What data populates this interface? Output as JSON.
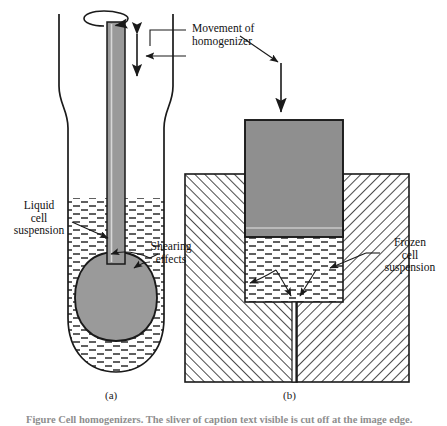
{
  "figure": {
    "type": "scientific-diagram",
    "caption_clipped": "Figure  Cell homogenizers. The sliver of caption text visible is cut off at the image edge.",
    "panels": [
      {
        "id": "a",
        "label": "(a)",
        "description": "Potter-Elvehjem style rotating pestle homogenizer in a glass tube containing liquid cell suspension"
      },
      {
        "id": "b",
        "label": "(b)",
        "description": "Frozen cell suspension forced through a narrow orifice by a descending plunger"
      }
    ]
  },
  "labels": {
    "movement": {
      "lines": [
        "Movement of",
        "homogenizer"
      ]
    },
    "liquid": {
      "lines": [
        "Liquid",
        "cell",
        "suspension"
      ]
    },
    "shearing": {
      "lines": [
        "Shearing",
        "effects"
      ]
    },
    "frozen": {
      "lines": [
        "Frozen",
        "cell",
        "suspension"
      ]
    }
  },
  "colors": {
    "outline": "#1a1a1a",
    "pestle_gray": "#9a9a9a",
    "plunger_gray": "#8f8f8f",
    "hatch": "#2b2b2b",
    "liquid_dash": "#2b2b2b",
    "text": "#111111",
    "caption_faint": "#8e8e8e"
  }
}
